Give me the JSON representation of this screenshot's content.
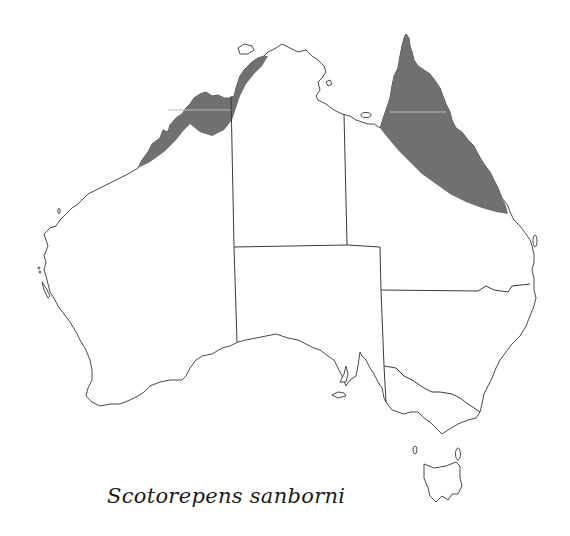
{
  "map": {
    "region": "Australia",
    "species_name": "Scotorepens sanborni",
    "range_color": "#707070",
    "outline_color": "#4a4a4a",
    "range_areas": [
      {
        "id": "kimberley-top-end",
        "description": "North-west coast: Kimberley to Top End"
      },
      {
        "id": "cape-york-queensland",
        "description": "Cape York and north-east Queensland coast"
      }
    ],
    "states": [
      "Western Australia",
      "Northern Territory",
      "Queensland",
      "South Australia",
      "New South Wales",
      "Victoria",
      "Tasmania"
    ]
  }
}
